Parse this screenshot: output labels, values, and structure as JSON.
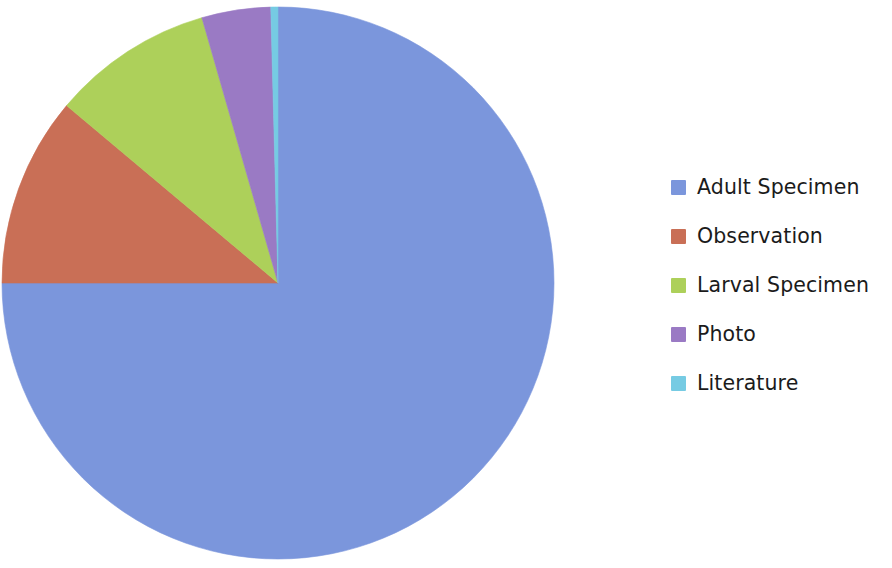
{
  "chart_data": {
    "type": "pie",
    "title": "",
    "subtitle": "",
    "xlabel": "",
    "ylabel": "",
    "legend_position": "right",
    "grid": false,
    "start_angle_deg": 0,
    "direction": "clockwise",
    "categories": [
      "Adult Specimen",
      "Observation",
      "Larval Specimen",
      "Photo",
      "Literature"
    ],
    "values": [
      75.1,
      11.1,
      9.4,
      4.0,
      0.4
    ],
    "unit": "percent",
    "colors": [
      "#7b96dc",
      "#c96f56",
      "#add05a",
      "#9a7ac4",
      "#76cbe3"
    ],
    "slices": [
      {
        "label": "Adult Specimen",
        "value": 75.1,
        "color": "#7b96dc",
        "start_deg": 0.0,
        "end_deg": 270.0
      },
      {
        "label": "Observation",
        "value": 11.1,
        "color": "#c96f56",
        "start_deg": 270.0,
        "end_deg": 310.0
      },
      {
        "label": "Larval Specimen",
        "value": 9.4,
        "color": "#add05a",
        "start_deg": 310.0,
        "end_deg": 344.0
      },
      {
        "label": "Photo",
        "value": 4.0,
        "color": "#9a7ac4",
        "start_deg": 344.0,
        "end_deg": 358.5
      },
      {
        "label": "Literature",
        "value": 0.4,
        "color": "#76cbe3",
        "start_deg": 358.5,
        "end_deg": 360.0
      }
    ],
    "annotations": []
  },
  "legend": {
    "items": [
      {
        "label": "Adult Specimen",
        "color": "#7b96dc"
      },
      {
        "label": "Observation",
        "color": "#c96f56"
      },
      {
        "label": "Larval Specimen",
        "color": "#add05a"
      },
      {
        "label": "Photo",
        "color": "#9a7ac4"
      },
      {
        "label": "Literature",
        "color": "#76cbe3"
      }
    ]
  },
  "geometry": {
    "center_x": 278,
    "center_y": 283,
    "radius": 276,
    "background": "#ffffff"
  }
}
